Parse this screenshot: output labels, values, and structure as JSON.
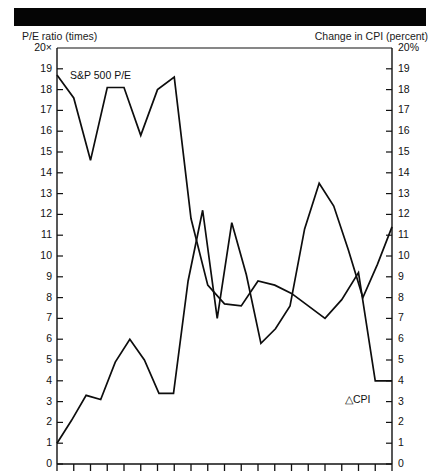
{
  "header": {
    "bar_color": "#050505"
  },
  "chart_data": {
    "type": "line",
    "title": "",
    "subtitle": "",
    "xlabel": "",
    "ylabel": "P/E ratio (times)",
    "y2label": "Change in CPI (percent)",
    "grid": false,
    "legend_position": "inline-annotations",
    "ylim": [
      0,
      20
    ],
    "y2lim": [
      0,
      20
    ],
    "left_axis_top_label": "20×",
    "right_axis_top_label": "20%",
    "left_tick_labels": [
      "20×",
      "19",
      "18",
      "17",
      "16",
      "15",
      "14",
      "13",
      "12",
      "11",
      "10",
      "9",
      "8",
      "7",
      "6",
      "5",
      "4",
      "3",
      "2",
      "1",
      "0"
    ],
    "right_tick_labels": [
      "20%",
      "19",
      "18",
      "17",
      "16",
      "15",
      "14",
      "13",
      "12",
      "11",
      "10",
      "9",
      "8",
      "7",
      "6",
      "5",
      "4",
      "3",
      "2",
      "1",
      "0"
    ],
    "tick_values": [
      20,
      19,
      18,
      17,
      16,
      15,
      14,
      13,
      12,
      11,
      10,
      9,
      8,
      7,
      6,
      5,
      4,
      3,
      2,
      1,
      0
    ],
    "x_tick_count": 21,
    "annotations": [
      {
        "name": "sp500-pe-label",
        "text": "S&P 500 P/E",
        "x_px": 70,
        "y_px": 69
      },
      {
        "name": "delta-cpi-label",
        "text": "△CPI",
        "x_px": 345,
        "y_px": 393
      }
    ],
    "series": [
      {
        "name": "S&P 500 P/E",
        "axis": "left",
        "color": "#0d0d0d",
        "values": [
          18.7,
          17.6,
          14.6,
          18.1,
          18.1,
          15.8,
          18.0,
          18.6,
          11.8,
          8.6,
          7.7,
          7.6,
          8.8,
          8.6,
          8.2,
          7.6,
          7.0,
          7.9,
          9.2,
          4.0,
          4.0
        ]
      },
      {
        "name": "△CPI",
        "axis": "right",
        "color": "#0d0d0d",
        "values": [
          1.0,
          2.1,
          3.3,
          3.1,
          4.9,
          6.0,
          5.0,
          3.4,
          3.4,
          8.8,
          12.2,
          7.0,
          11.6,
          9.1,
          5.8,
          6.5,
          7.6,
          11.3,
          13.5,
          12.4,
          10.3,
          8.0,
          9.6,
          11.4
        ]
      }
    ]
  },
  "axes": {
    "left_title": "P/E ratio (times)",
    "right_title": "Change in CPI (percent)"
  }
}
